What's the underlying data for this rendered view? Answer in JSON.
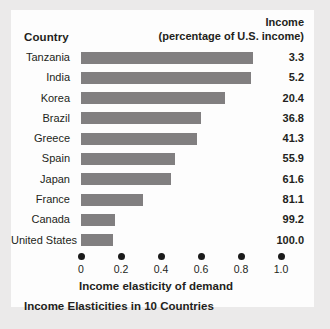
{
  "header": {
    "country_label": "Country",
    "income_label_line1": "Income",
    "income_label_line2": "(percentage of U.S. income)"
  },
  "axis": {
    "title": "Income elasticity of demand",
    "ticks": [
      "0",
      "0.2",
      "0.4",
      "0.6",
      "0.8",
      "1.0"
    ],
    "tick_values": [
      0,
      0.2,
      0.4,
      0.6,
      0.8,
      1.0
    ],
    "min": 0,
    "max": 1.0
  },
  "caption": "Income Elasticities in 10 Countries",
  "colors": {
    "bar": "#817f80",
    "text": "#231f20",
    "card": "#fdfdfd",
    "page": "#ebeaea",
    "tick_dot": "#1a1a1a"
  },
  "chart_data": {
    "type": "bar",
    "orientation": "horizontal",
    "title": "Income Elasticities in 10 Countries",
    "xlabel": "Income elasticity of demand",
    "ylabel": "Country",
    "xlim": [
      0,
      1.0
    ],
    "grid": false,
    "legend": "none",
    "categories": [
      "Tanzania",
      "India",
      "Korea",
      "Brazil",
      "Greece",
      "Spain",
      "Japan",
      "France",
      "Canada",
      "United States"
    ],
    "values": [
      0.86,
      0.85,
      0.72,
      0.6,
      0.58,
      0.47,
      0.45,
      0.31,
      0.17,
      0.16
    ],
    "annotations": {
      "label": "Income (percentage of U.S. income)",
      "values": [
        "3.3",
        "5.2",
        "20.4",
        "36.8",
        "41.3",
        "55.9",
        "61.6",
        "81.1",
        "99.2",
        "100.0"
      ]
    },
    "rows": [
      {
        "country": "Tanzania",
        "elasticity": 0.86,
        "income_pct": "3.3"
      },
      {
        "country": "India",
        "elasticity": 0.85,
        "income_pct": "5.2"
      },
      {
        "country": "Korea",
        "elasticity": 0.72,
        "income_pct": "20.4"
      },
      {
        "country": "Brazil",
        "elasticity": 0.6,
        "income_pct": "36.8"
      },
      {
        "country": "Greece",
        "elasticity": 0.58,
        "income_pct": "41.3"
      },
      {
        "country": "Spain",
        "elasticity": 0.47,
        "income_pct": "55.9"
      },
      {
        "country": "Japan",
        "elasticity": 0.45,
        "income_pct": "61.6"
      },
      {
        "country": "France",
        "elasticity": 0.31,
        "income_pct": "81.1"
      },
      {
        "country": "Canada",
        "elasticity": 0.17,
        "income_pct": "99.2"
      },
      {
        "country": "United States",
        "elasticity": 0.16,
        "income_pct": "100.0"
      }
    ]
  }
}
